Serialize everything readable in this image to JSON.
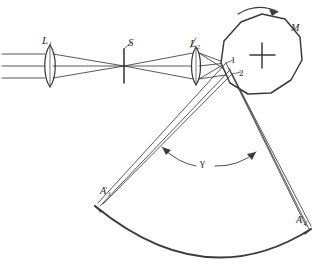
{
  "figure": {
    "type": "optical-ray-diagram",
    "ink_color": "#3b3b3b",
    "background_color": "#ffffff",
    "labels": {
      "lens1": {
        "base": "L",
        "sub": "1",
        "name": "collimating-lens-L1"
      },
      "slit": {
        "base": "S",
        "name": "slit-S"
      },
      "lens2": {
        "base": "L",
        "sub": "2",
        "name": "imaging-lens-L2"
      },
      "mirror": {
        "base": "M",
        "name": "rotating-polygon-mirror-M"
      },
      "facet_point_1": {
        "base": "1",
        "name": "reflection-point-1"
      },
      "facet_point_2": {
        "base": "2",
        "name": "reflection-point-2"
      },
      "angle": {
        "base": "γ",
        "name": "scan-angle-gamma"
      },
      "image_point_1": {
        "base": "A",
        "sub": "1",
        "prime": "′",
        "name": "image-point-A1-prime"
      },
      "image_point_2": {
        "base": "A",
        "sub": "2",
        "prime": "′",
        "name": "image-point-A2-prime"
      }
    },
    "components": {
      "lens1_label": "L1",
      "slit_label": "S",
      "lens2_label": "L2",
      "mirror_label": "M",
      "rotation": "clockwise",
      "facet_labels": [
        "1",
        "2"
      ],
      "angle_label": "γ",
      "focal_surface_labels": [
        "A′1",
        "A′2"
      ]
    },
    "geometry": {
      "incoming_rays_y": [
        54,
        66,
        78
      ],
      "lens1_center": [
        50,
        66
      ],
      "slit_x": 124,
      "lens2_center": [
        196,
        66
      ],
      "polygon_center": [
        262,
        55
      ],
      "polygon_radius": 41,
      "polygon_sides": 11,
      "facet_point_1": [
        226,
        63
      ],
      "facet_point_2": [
        232,
        74
      ],
      "arc_left_end": [
        95,
        206
      ],
      "arc_right_end": [
        311,
        229
      ],
      "arc_bottom": [
        205,
        257
      ]
    }
  }
}
